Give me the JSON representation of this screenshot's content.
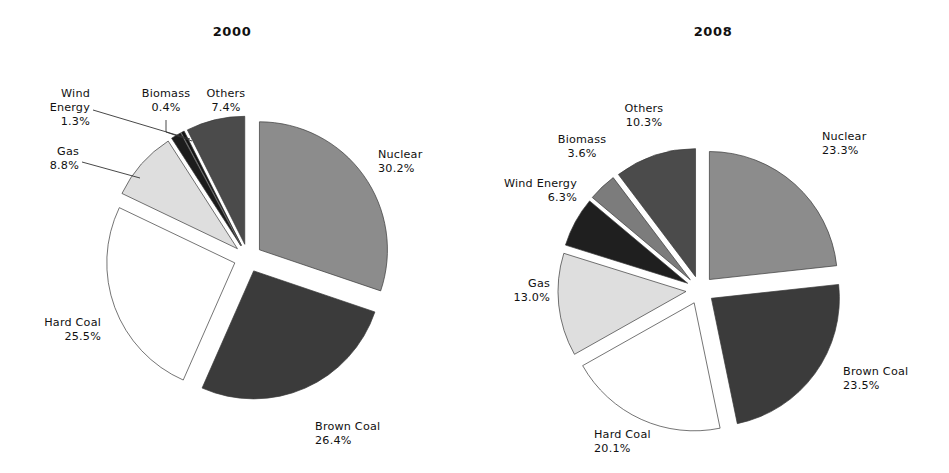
{
  "page": {
    "background_color": "#ffffff",
    "text_color": "#111111"
  },
  "chart_data": [
    {
      "type": "pie",
      "title": "2000",
      "chart_id": "pie-2000",
      "center": [
        248,
        258
      ],
      "radius": 128,
      "start_angle_deg": -90,
      "direction": "clockwise",
      "categories": [
        "Nuclear",
        "Brown Coal",
        "Hard Coal",
        "Gas",
        "Wind Energy",
        "Biomass",
        "Others"
      ],
      "values": [
        30.2,
        26.4,
        25.5,
        8.8,
        1.3,
        0.4,
        7.4
      ],
      "value_suffix": "%",
      "legend": "none",
      "grid": false,
      "exploded": true,
      "slices": [
        {
          "label": "Nuclear",
          "value": 30.2,
          "value_text": "30.2%",
          "color": "#8c8c8c",
          "explode": 0.11,
          "label_x": 378,
          "label_y": 158,
          "label_anchor": "start",
          "leader": false
        },
        {
          "label": "Brown Coal",
          "value": 26.4,
          "value_text": "26.4%",
          "color": "#3b3b3b",
          "explode": 0.11,
          "label_x": 315,
          "label_y": 430,
          "label_anchor": "start",
          "leader": false
        },
        {
          "label": "Hard Coal",
          "value": 25.5,
          "value_text": "25.5%",
          "color": "#ffffff",
          "explode": 0.11,
          "label_x": 101,
          "label_y": 326,
          "label_anchor": "end",
          "leader": false
        },
        {
          "label": "Gas",
          "value": 8.8,
          "value_text": "8.8%",
          "color": "#dedede",
          "explode": 0.11,
          "label_x": 79,
          "label_y": 155,
          "label_anchor": "end",
          "leader": true,
          "leader_points": "82,162 140,178"
        },
        {
          "label": "Wind Energy",
          "value": 1.3,
          "value_text": "1.3%",
          "color": "#1c1c1c",
          "explode": 0.11,
          "label_x": 90,
          "label_y": 97,
          "label_anchor": "end",
          "leader": true,
          "leader_points": "93,110 190,139"
        },
        {
          "label": "Biomass",
          "value": 0.4,
          "value_text": "0.4%",
          "color": "#141414",
          "explode": 0.11,
          "label_x": 166,
          "label_y": 97,
          "label_anchor": "middle",
          "leader": true,
          "leader_points": "166,120 166,132 192,141"
        },
        {
          "label": "Others",
          "value": 7.4,
          "value_text": "7.4%",
          "color": "#4b4b4b",
          "explode": 0.11,
          "label_x": 226,
          "label_y": 97,
          "label_anchor": "middle",
          "leader": false
        }
      ]
    },
    {
      "type": "pie",
      "title": "2008",
      "chart_id": "pie-2008",
      "center": [
        700,
        290
      ],
      "radius": 128,
      "start_angle_deg": -90,
      "direction": "clockwise",
      "categories": [
        "Nuclear",
        "Brown Coal",
        "Hard Coal",
        "Gas",
        "Wind Energy",
        "Biomass",
        "Others"
      ],
      "values": [
        23.3,
        23.5,
        20.1,
        13.0,
        6.3,
        3.6,
        10.3
      ],
      "value_suffix": "%",
      "legend": "none",
      "grid": false,
      "exploded": true,
      "slices": [
        {
          "label": "Nuclear",
          "value": 23.3,
          "value_text": "23.3%",
          "color": "#8c8c8c",
          "explode": 0.11,
          "label_x": 822,
          "label_y": 140,
          "label_anchor": "start",
          "leader": false
        },
        {
          "label": "Brown Coal",
          "value": 23.5,
          "value_text": "23.5%",
          "color": "#3b3b3b",
          "explode": 0.11,
          "label_x": 843,
          "label_y": 375,
          "label_anchor": "start",
          "leader": false
        },
        {
          "label": "Hard Coal",
          "value": 20.1,
          "value_text": "20.1%",
          "color": "#ffffff",
          "explode": 0.11,
          "label_x": 594,
          "label_y": 438,
          "label_anchor": "start",
          "leader": false
        },
        {
          "label": "Gas",
          "value": 13.0,
          "value_text": "13.0%",
          "color": "#dedede",
          "explode": 0.11,
          "label_x": 550,
          "label_y": 287,
          "label_anchor": "end",
          "leader": false
        },
        {
          "label": "Wind Energy",
          "value": 6.3,
          "value_text": "6.3%",
          "color": "#1f1f1f",
          "explode": 0.11,
          "label_x": 577,
          "label_y": 187,
          "label_anchor": "end",
          "leader": false
        },
        {
          "label": "Biomass",
          "value": 3.6,
          "value_text": "3.6%",
          "color": "#7c7c7c",
          "explode": 0.11,
          "label_x": 582,
          "label_y": 143,
          "label_anchor": "middle",
          "leader": false
        },
        {
          "label": "Others",
          "value": 10.3,
          "value_text": "10.3%",
          "color": "#4b4b4b",
          "explode": 0.11,
          "label_x": 644,
          "label_y": 112,
          "label_anchor": "middle",
          "leader": false
        }
      ]
    }
  ],
  "titles": {
    "left": "2000",
    "right": "2008",
    "left_x": 232,
    "left_y": 36,
    "right_x": 713,
    "right_y": 36
  }
}
